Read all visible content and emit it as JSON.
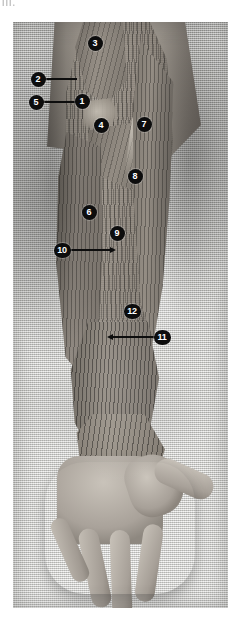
{
  "figure": {
    "kind": "anatomical-photograph",
    "top_artifact_text": "III.",
    "plate": {
      "background_description": "light gray woven cloth drape",
      "background_color": "#c9c9c5",
      "skin_color": "#b0aaa2",
      "muscle_color": "#8b857c",
      "marker_fill": "#0d0d0d",
      "marker_text_color": "#ffffff",
      "leader_color": "#0d0d0d"
    },
    "markers": [
      {
        "id": "m1",
        "label": "1",
        "x": 82,
        "y": 101,
        "leader": null
      },
      {
        "id": "m2",
        "label": "2",
        "x": 38,
        "y": 79,
        "leader": {
          "direction": "right",
          "length": 32,
          "arrow": false
        }
      },
      {
        "id": "m3",
        "label": "3",
        "x": 95,
        "y": 43,
        "leader": null
      },
      {
        "id": "m4",
        "label": "4",
        "x": 101,
        "y": 125,
        "leader": null
      },
      {
        "id": "m5",
        "label": "5",
        "x": 36,
        "y": 102,
        "leader": {
          "direction": "right",
          "length": 38,
          "arrow": true
        }
      },
      {
        "id": "m6",
        "label": "6",
        "x": 89,
        "y": 212,
        "leader": null
      },
      {
        "id": "m7",
        "label": "7",
        "x": 144,
        "y": 124,
        "leader": null
      },
      {
        "id": "m8",
        "label": "8",
        "x": 135,
        "y": 176,
        "leader": null
      },
      {
        "id": "m9",
        "label": "9",
        "x": 117,
        "y": 233,
        "leader": null
      },
      {
        "id": "m10",
        "label": "10",
        "x": 62,
        "y": 250,
        "leader": {
          "direction": "right",
          "length": 40,
          "arrow": true
        }
      },
      {
        "id": "m11",
        "label": "11",
        "x": 162,
        "y": 337,
        "leader": {
          "direction": "left",
          "length": 42,
          "arrow": true
        }
      },
      {
        "id": "m12",
        "label": "12",
        "x": 132,
        "y": 311,
        "leader": null
      }
    ]
  }
}
